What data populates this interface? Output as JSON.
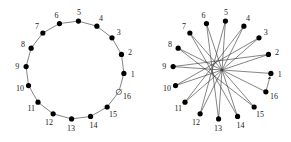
{
  "figures": [
    {
      "name": "cycle-graph",
      "node_labels": [
        "1",
        "2",
        "3",
        "4",
        "5",
        "6",
        "7",
        "8",
        "9",
        "10",
        "11",
        "12",
        "13",
        "14",
        "15",
        "16"
      ],
      "open_node": "16",
      "edges": [
        [
          1,
          2
        ],
        [
          2,
          3
        ],
        [
          3,
          4
        ],
        [
          4,
          5
        ],
        [
          5,
          6
        ],
        [
          6,
          7
        ],
        [
          7,
          8
        ],
        [
          8,
          9
        ],
        [
          9,
          10
        ],
        [
          10,
          11
        ],
        [
          11,
          12
        ],
        [
          12,
          13
        ],
        [
          13,
          14
        ],
        [
          14,
          15
        ],
        [
          15,
          16
        ],
        [
          16,
          1
        ]
      ],
      "colors": {
        "node": "#000000",
        "edge": "#333333"
      }
    },
    {
      "name": "star-chord-graph",
      "node_labels": [
        "1",
        "2",
        "3",
        "4",
        "5",
        "6",
        "7",
        "8",
        "9",
        "10",
        "11",
        "12",
        "13",
        "14",
        "15",
        "16"
      ],
      "edges": [
        [
          1,
          9
        ],
        [
          9,
          2
        ],
        [
          2,
          10
        ],
        [
          10,
          3
        ],
        [
          3,
          11
        ],
        [
          11,
          4
        ],
        [
          4,
          12
        ],
        [
          12,
          5
        ],
        [
          5,
          13
        ],
        [
          13,
          6
        ],
        [
          6,
          14
        ],
        [
          14,
          7
        ],
        [
          7,
          15
        ],
        [
          15,
          8
        ],
        [
          8,
          16
        ]
      ],
      "arrow_edge": [
        16,
        1
      ],
      "colors": {
        "node": "#000000",
        "edge": "#333333"
      }
    }
  ]
}
